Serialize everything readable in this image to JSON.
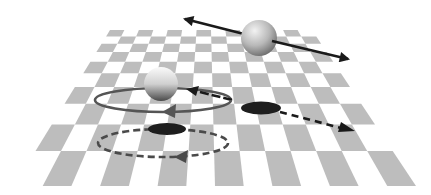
{
  "figure": {
    "colors": {
      "background": "#ffffff",
      "checker_dark": "#bdbdbd",
      "checker_light": "#ffffff",
      "arrow_black": "#1a1a1a",
      "orbit_gray": "#555555",
      "shadow": "#1e1e1e",
      "sphere_light": "#f4f4f4",
      "sphere_dark": "#6e6e6e"
    },
    "plane": {
      "rows": 10,
      "cols": 14,
      "top_left": [
        110,
        30
      ],
      "top_right": [
        312,
        30
      ],
      "bottom_left": [
        14,
        186
      ],
      "bottom_right": [
        416,
        186
      ]
    },
    "objects": [
      {
        "name": "translating-sphere",
        "cx": 259,
        "cy": 38,
        "r": 18
      },
      {
        "name": "orbiting-sphere",
        "cx": 161,
        "cy": 84,
        "r": 17
      }
    ],
    "arrows": [
      {
        "name": "translation-arrow",
        "style": "solid",
        "double_headed": true,
        "from": [
          182,
          18
        ],
        "to": [
          350,
          60
        ]
      },
      {
        "name": "orbit-path",
        "style": "solid",
        "cx": 163,
        "cy": 100,
        "rx": 68,
        "ry": 12
      },
      {
        "name": "shadow-translation-arrow",
        "style": "dashed",
        "from": [
          262,
          108
        ],
        "to": [
          353,
          131
        ]
      },
      {
        "name": "shadow-orbit-path",
        "style": "dashed",
        "cx": 163,
        "cy": 143,
        "rx": 65,
        "ry": 14
      },
      {
        "name": "short-return-arrow",
        "style": "solid",
        "from": [
          230,
          98
        ],
        "to": [
          188,
          89
        ]
      }
    ],
    "shadows": [
      {
        "name": "translating-sphere-shadow",
        "cx": 261,
        "cy": 108,
        "rx": 20,
        "ry": 6
      },
      {
        "name": "orbiting-sphere-shadow",
        "cx": 167,
        "cy": 129,
        "rx": 19,
        "ry": 6
      }
    ]
  }
}
